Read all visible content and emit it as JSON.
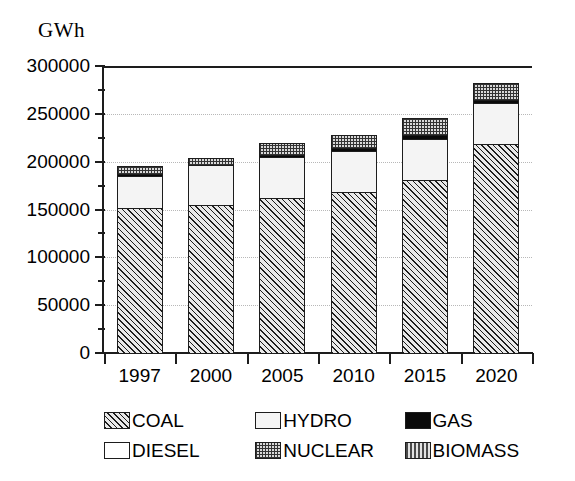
{
  "chart_data": {
    "type": "bar",
    "stacked": true,
    "title": "",
    "subtitle": "",
    "xlabel": "",
    "ylabel": "GWh",
    "unit_caption": "GWh",
    "categories": [
      "1997",
      "2000",
      "2005",
      "2010",
      "2015",
      "2020"
    ],
    "ylim": [
      0,
      300000
    ],
    "ytick_step": 50000,
    "ytick_labels": [
      "300000",
      "250000",
      "200000",
      "150000",
      "100000",
      "50000",
      "0"
    ],
    "ytick_values": [
      300000,
      250000,
      200000,
      150000,
      100000,
      50000,
      0
    ],
    "grid": true,
    "grid_style": "dotted",
    "legend_position": "bottom",
    "series": [
      {
        "name": "COAL",
        "pattern": "diagonal-hatch",
        "values": [
          152000,
          155000,
          162000,
          168000,
          181000,
          218000
        ]
      },
      {
        "name": "HYDRO",
        "pattern": "light-fill",
        "values": [
          33000,
          42000,
          43000,
          43000,
          43000,
          43000
        ]
      },
      {
        "name": "GAS",
        "pattern": "solid-black",
        "values": [
          2000,
          0,
          1000,
          3000,
          4000,
          4000
        ]
      },
      {
        "name": "DIESEL",
        "pattern": "white-fill",
        "values": [
          0,
          0,
          0,
          0,
          0,
          0
        ]
      },
      {
        "name": "NUCLEAR",
        "pattern": "checker-stipple",
        "values": [
          8000,
          7000,
          12000,
          14000,
          18000,
          17000
        ]
      },
      {
        "name": "BIOMASS",
        "pattern": "vertical-stripe",
        "values": [
          0,
          0,
          0,
          0,
          0,
          0
        ]
      }
    ],
    "totals": [
      195000,
      204000,
      218000,
      228000,
      246000,
      282000
    ]
  },
  "legend": {
    "rows": [
      [
        {
          "label": "COAL",
          "pattern": "pat-coal"
        },
        {
          "label": "HYDRO",
          "pattern": "pat-hydro"
        },
        {
          "label": "GAS",
          "pattern": "pat-gas"
        }
      ],
      [
        {
          "label": "DIESEL",
          "pattern": "pat-diesel"
        },
        {
          "label": "NUCLEAR",
          "pattern": "pat-nuclear"
        },
        {
          "label": "BIOMASS",
          "pattern": "pat-biomass"
        }
      ]
    ]
  },
  "colors": {
    "axis": "#1d1d1d",
    "grid": "#b8b8b8",
    "background": "#ffffff",
    "coal": "#e9e9e9",
    "hydro": "#f4f4f4",
    "gas": "#0a0a0a",
    "diesel": "#ffffff",
    "nuclear": "#d9d9d9",
    "biomass": "#e2e2e2"
  }
}
